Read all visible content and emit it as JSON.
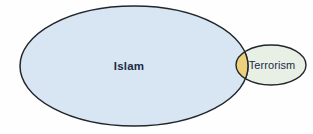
{
  "figure": {
    "type": "venn",
    "kind": "two-set-venn-diagram",
    "background_color": "#fefefe",
    "title": "",
    "caption": ""
  },
  "sets": [
    {
      "id": "islam",
      "label": "Islam",
      "fill_color": "#d7e6f2",
      "stroke_color": "#22262b",
      "label_color": "#1b2b44",
      "label_weight": "bold",
      "shape": "ellipse",
      "cx": 134,
      "cy": 66,
      "rx": 114,
      "ry": 60,
      "label_x": 129,
      "label_y": 70
    },
    {
      "id": "terrorism",
      "label": "Terrorism",
      "fill_color": "#e8efe5",
      "stroke_color": "#22262b",
      "label_color": "#1b2b44",
      "label_weight": "normal",
      "shape": "ellipse",
      "cx": 271,
      "cy": 65,
      "rx": 35,
      "ry": 20,
      "label_x": 272,
      "label_y": 69
    }
  ],
  "intersection": {
    "id": "islam-terrorism-overlap",
    "label": "",
    "fill_color": "#ecd07c",
    "stroke_color": "#22262b"
  },
  "colors": {
    "accent_blue": "#d7e6f2",
    "accent_green": "#e8efe5",
    "accent_gold": "#ecd07c",
    "outline": "#22262b",
    "text": "#1b2b44",
    "background": "#fefefe"
  }
}
